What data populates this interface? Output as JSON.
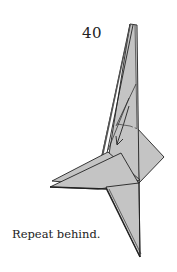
{
  "diagram": {
    "step_number": "40",
    "caption": "Repeat behind.",
    "colors": {
      "paper": "#c4c4c4",
      "paper_dark": "#8a8a8a",
      "line": "#222222",
      "background": "#ffffff"
    },
    "symbols": [
      "fold-arrow",
      "valley-fold-line"
    ]
  }
}
